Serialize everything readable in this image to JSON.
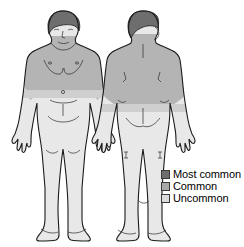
{
  "illustration": {
    "title": "Body distribution diagram",
    "views": [
      {
        "name": "anterior-view",
        "label": "Front view"
      },
      {
        "name": "posterior-view",
        "label": "Back view"
      }
    ]
  },
  "colors": {
    "most_common": "#6e6e6e",
    "common": "#a8a8a8",
    "uncommon": "#dcdcdc",
    "outline": "#1a1a1a",
    "background": "#ffffff",
    "hair_front": "#6e6e6e",
    "hair_back": "#6e6e6e",
    "skin_light": "#e8e8e8",
    "skin_mid": "#b4b4b4"
  },
  "legend": {
    "items": [
      {
        "label": "Most common",
        "color": "#6e6e6e"
      },
      {
        "label": "Common",
        "color": "#a8a8a8"
      },
      {
        "label": "Uncommon",
        "color": "#dcdcdc"
      }
    ]
  },
  "regions": {
    "front": [
      {
        "name": "hair",
        "severity": "Most common"
      },
      {
        "name": "chest-and-shoulders",
        "severity": "Common"
      },
      {
        "name": "upper-arms",
        "severity": "Common"
      },
      {
        "name": "abdomen-and-legs",
        "severity": "Uncommon"
      }
    ],
    "back": [
      {
        "name": "scalp",
        "severity": "Most common"
      },
      {
        "name": "upper-back-and-shoulders",
        "severity": "Common"
      },
      {
        "name": "lower-back-and-legs",
        "severity": "Uncommon"
      }
    ]
  }
}
